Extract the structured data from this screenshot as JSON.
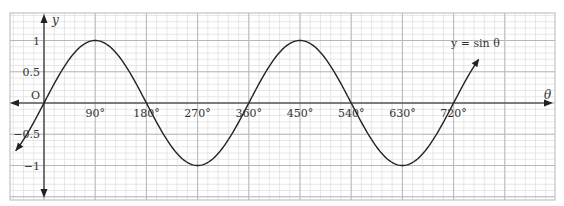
{
  "chart_data": {
    "type": "line",
    "title": "",
    "function_label": "y = sin θ",
    "xlabel": "θ",
    "ylabel": "y",
    "origin_label": "O",
    "x_tick_labels": [
      "90°",
      "180°",
      "270°",
      "360°",
      "450°",
      "540°",
      "630°",
      "720°"
    ],
    "x_ticks": [
      90,
      180,
      270,
      360,
      450,
      540,
      630,
      720
    ],
    "y_tick_labels": [
      "1",
      "0.5",
      "−0.5",
      "−1"
    ],
    "y_ticks": [
      1,
      0.5,
      -0.5,
      -1
    ],
    "xlim": [
      -60,
      900
    ],
    "ylim": [
      -1.3,
      1.4
    ],
    "grid": true,
    "legend": "none",
    "series": [
      {
        "name": "y = sin θ",
        "x_range_deg": [
          -50,
          765
        ],
        "x": [
          -45,
          0,
          45,
          90,
          135,
          180,
          225,
          270,
          315,
          360,
          405,
          450,
          495,
          540,
          585,
          630,
          675,
          720,
          765
        ],
        "values": [
          -0.71,
          0,
          0.71,
          1,
          0.71,
          0,
          -0.71,
          -1,
          -0.71,
          0,
          0.71,
          1,
          0.71,
          0,
          -0.71,
          -1,
          -0.71,
          0,
          0.71
        ]
      }
    ]
  },
  "colors": {
    "grid_major": "#b8b8b8",
    "grid_minor": "#dcdcdc",
    "axis": "#222222",
    "curve": "#222222"
  }
}
